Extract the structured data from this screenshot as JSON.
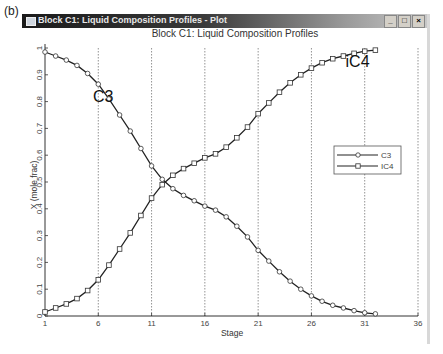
{
  "panel_label": "(b)",
  "window": {
    "title": "Block C1: Liquid Composition Profiles - Plot",
    "buttons": {
      "minimize": "_",
      "maximize": "□",
      "close": "×"
    }
  },
  "chart_data": {
    "type": "line",
    "title": "Block C1: Liquid Composition Profiles",
    "xlabel": "Stage",
    "ylabel": "X (mole frac)",
    "xlim": [
      1,
      36
    ],
    "ylim": [
      0,
      1
    ],
    "xticks": [
      1,
      6,
      11,
      16,
      21,
      26,
      31,
      36
    ],
    "yticks": [
      0,
      0.1,
      0.2,
      0.3,
      0.4,
      0.5,
      0.6,
      0.7,
      0.8,
      0.9,
      1
    ],
    "ytick_labels": [
      "0",
      "0.1",
      "0.2",
      "0.3",
      "0.4",
      "0.5",
      "0.6",
      "0.7",
      "0.8",
      "0.9",
      "1"
    ],
    "grid": "vertical-dotted",
    "legend": "right",
    "x": [
      1,
      2,
      3,
      4,
      5,
      6,
      7,
      8,
      9,
      10,
      11,
      12,
      13,
      14,
      15,
      16,
      17,
      18,
      19,
      20,
      21,
      22,
      23,
      24,
      25,
      26,
      27,
      28,
      29,
      30,
      31,
      32
    ],
    "series": [
      {
        "name": "C3",
        "marker": "circle",
        "values": [
          0.985,
          0.97,
          0.955,
          0.935,
          0.905,
          0.865,
          0.81,
          0.75,
          0.69,
          0.625,
          0.56,
          0.51,
          0.475,
          0.45,
          0.43,
          0.41,
          0.395,
          0.37,
          0.335,
          0.295,
          0.245,
          0.205,
          0.165,
          0.13,
          0.1,
          0.075,
          0.055,
          0.04,
          0.03,
          0.02,
          0.012,
          0.008
        ]
      },
      {
        "name": "IC4",
        "marker": "square",
        "values": [
          0.015,
          0.03,
          0.045,
          0.065,
          0.095,
          0.135,
          0.19,
          0.25,
          0.31,
          0.375,
          0.44,
          0.49,
          0.525,
          0.55,
          0.57,
          0.59,
          0.605,
          0.63,
          0.665,
          0.705,
          0.755,
          0.795,
          0.835,
          0.87,
          0.9,
          0.925,
          0.945,
          0.96,
          0.97,
          0.98,
          0.988,
          0.992
        ]
      }
    ],
    "annotations": [
      {
        "text": "C3",
        "x": 5.5,
        "y": 0.8
      },
      {
        "text": "iC4",
        "x": 29.2,
        "y": 0.93
      }
    ]
  }
}
